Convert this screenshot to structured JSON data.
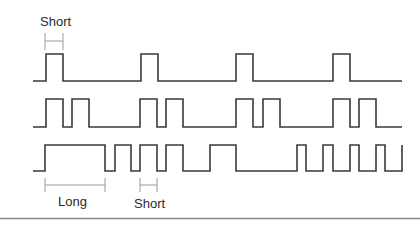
{
  "diagram": {
    "waveforms": [
      {
        "name": "waveform-1",
        "transitions": [
          [
            0,
            0
          ],
          [
            46,
            1
          ],
          [
            63,
            0
          ],
          [
            141,
            1
          ],
          [
            158,
            0
          ],
          [
            236,
            1
          ],
          [
            253,
            0
          ],
          [
            333,
            1
          ],
          [
            350,
            0
          ],
          [
            402,
            0
          ]
        ]
      },
      {
        "name": "waveform-2",
        "transitions": [
          [
            0,
            0
          ],
          [
            46,
            1
          ],
          [
            63,
            0
          ],
          [
            72,
            1
          ],
          [
            89,
            0
          ],
          [
            140,
            1
          ],
          [
            157,
            0
          ],
          [
            166,
            1
          ],
          [
            183,
            0
          ],
          [
            236,
            1
          ],
          [
            253,
            0
          ],
          [
            263,
            1
          ],
          [
            280,
            0
          ],
          [
            333,
            1
          ],
          [
            350,
            0
          ],
          [
            359,
            1
          ],
          [
            376,
            0
          ],
          [
            402,
            0
          ]
        ]
      },
      {
        "name": "waveform-3",
        "transitions": [
          [
            0,
            0
          ],
          [
            45,
            1
          ],
          [
            105,
            0
          ],
          [
            115,
            1
          ],
          [
            131,
            0
          ],
          [
            140,
            1
          ],
          [
            157,
            0
          ],
          [
            166,
            1
          ],
          [
            183,
            0
          ],
          [
            210,
            1
          ],
          [
            236,
            0
          ],
          [
            297,
            1
          ],
          [
            306,
            0
          ],
          [
            323,
            1
          ],
          [
            333,
            0
          ],
          [
            350,
            1
          ],
          [
            359,
            0
          ],
          [
            376,
            1
          ],
          [
            385,
            0
          ],
          [
            402,
            1
          ],
          [
            402,
            0
          ]
        ]
      }
    ],
    "labels": {
      "short_top": "Short",
      "long_bottom": "Long",
      "short_bottom": "Short"
    },
    "line_color": "#3a3a3a",
    "dimension_color": "#9a9a9a"
  }
}
